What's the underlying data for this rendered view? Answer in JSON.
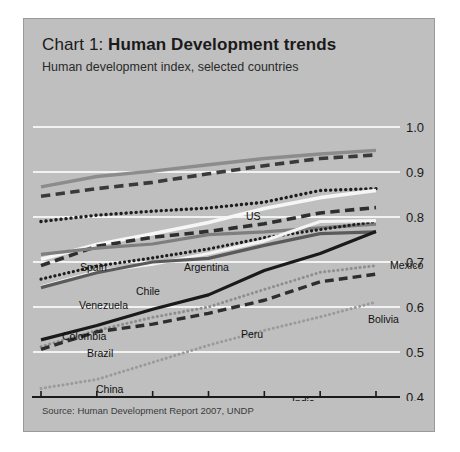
{
  "panel": {
    "background_color": "#bfbfbf",
    "border_color": "#9a9a9a"
  },
  "header": {
    "title_lead": "Chart 1: ",
    "title_strong": "Human Development trends",
    "subtitle": "Human development index, selected countries"
  },
  "footer": {
    "source": "Source: Human Development Report 2007, UNDP"
  },
  "chart_data": {
    "type": "line",
    "title": "Chart 1: Human Development trends",
    "subtitle": "Human development index, selected countries",
    "xlabel": "",
    "ylabel": "Human development index",
    "x": [
      1975,
      1980,
      1985,
      1990,
      1995,
      2000,
      2004
    ],
    "xtick_labels": [
      "1975",
      "1980",
      "1985",
      "1990",
      "1995",
      "2000",
      "04"
    ],
    "ylim": [
      0.4,
      1.0
    ],
    "ytick_labels": [
      "0.4",
      "0.5",
      "0.6",
      "0.7",
      "0.8",
      "0.9",
      "1.0"
    ],
    "yticks": [
      0.4,
      0.5,
      0.6,
      0.7,
      0.8,
      0.9,
      1.0
    ],
    "grid": true,
    "grid_color": "#f2f2f2",
    "axis_color": "#1a1a1a",
    "legend": "inline-labels",
    "series": [
      {
        "name": "US",
        "style": "solid",
        "color": "#8c8c8c",
        "width": 3.4,
        "values": [
          0.867,
          0.89,
          0.902,
          0.916,
          0.93,
          0.94,
          0.948
        ]
      },
      {
        "name": "Spain",
        "style": "dashed",
        "color": "#3a3a3a",
        "width": 3.6,
        "values": [
          0.846,
          0.863,
          0.877,
          0.896,
          0.914,
          0.93,
          0.938
        ]
      },
      {
        "name": "Argentina",
        "style": "dotted",
        "color": "#1e1e1e",
        "width": 3.4,
        "values": [
          0.79,
          0.804,
          0.813,
          0.82,
          0.833,
          0.859,
          0.863
        ]
      },
      {
        "name": "Chile",
        "style": "solid",
        "color": "#f6f6f6",
        "width": 3.6,
        "values": [
          0.706,
          0.739,
          0.763,
          0.788,
          0.819,
          0.843,
          0.859
        ]
      },
      {
        "name": "Mexico",
        "style": "dashed",
        "color": "#2e2e2e",
        "width": 3.6,
        "values": [
          0.692,
          0.735,
          0.755,
          0.768,
          0.785,
          0.809,
          0.821
        ]
      },
      {
        "name": "Venezuela",
        "style": "solid",
        "color": "#7e7e7e",
        "width": 3.2,
        "values": [
          0.717,
          0.731,
          0.74,
          0.761,
          0.767,
          0.776,
          0.784
        ]
      },
      {
        "name": "Colombia",
        "style": "dotted",
        "color": "#1e1e1e",
        "width": 3.2,
        "values": [
          0.662,
          0.691,
          0.709,
          0.729,
          0.754,
          0.772,
          0.79
        ]
      },
      {
        "name": "Brazil",
        "style": "solid",
        "color": "#f3f3f3",
        "width": 3.2,
        "values": [
          0.645,
          0.679,
          0.695,
          0.719,
          0.747,
          0.79,
          0.792
        ]
      },
      {
        "name": "Peru",
        "style": "solid",
        "color": "#5a5a5a",
        "width": 3.2,
        "values": [
          0.643,
          0.676,
          0.7,
          0.708,
          0.737,
          0.763,
          0.767
        ]
      },
      {
        "name": "China",
        "style": "solid",
        "color": "#1a1a1a",
        "width": 3.2,
        "values": [
          0.527,
          0.559,
          0.595,
          0.627,
          0.681,
          0.719,
          0.768
        ]
      },
      {
        "name": "Bolivia",
        "style": "dotted",
        "color": "#8e8e8e",
        "width": 3.0,
        "values": [
          0.512,
          0.548,
          0.577,
          0.6,
          0.639,
          0.677,
          0.692
        ]
      },
      {
        "name": "Guatemala",
        "style": "dashed",
        "color": "#2e2e2e",
        "width": 3.4,
        "values": [
          0.506,
          0.545,
          0.562,
          0.586,
          0.615,
          0.656,
          0.673
        ]
      },
      {
        "name": "India",
        "style": "dotted",
        "color": "#9a9a9a",
        "width": 3.0,
        "values": [
          0.419,
          0.439,
          0.477,
          0.515,
          0.548,
          0.578,
          0.611
        ]
      }
    ],
    "annotations": [
      {
        "label": "US",
        "x": 222,
        "y": 139,
        "anchor": "start"
      },
      {
        "label": "Spain",
        "x": 56,
        "y": 190,
        "anchor": "start"
      },
      {
        "label": "Argentina",
        "x": 160,
        "y": 190,
        "anchor": "start"
      },
      {
        "label": "Mexico",
        "x": 366,
        "y": 188,
        "anchor": "start"
      },
      {
        "label": "Chile",
        "x": 112,
        "y": 214,
        "anchor": "start"
      },
      {
        "label": "Venezuela",
        "x": 55,
        "y": 228,
        "anchor": "start"
      },
      {
        "label": "Colombia",
        "x": 38,
        "y": 259,
        "anchor": "start"
      },
      {
        "label": "Brazil",
        "x": 63,
        "y": 276,
        "anchor": "start"
      },
      {
        "label": "Peru",
        "x": 217,
        "y": 257,
        "anchor": "start"
      },
      {
        "label": "Bolivia",
        "x": 344,
        "y": 242,
        "anchor": "start"
      },
      {
        "label": "China",
        "x": 72,
        "y": 312,
        "anchor": "start"
      },
      {
        "label": "Guatemala",
        "x": 150,
        "y": 330,
        "anchor": "start"
      },
      {
        "label": "India",
        "x": 268,
        "y": 325,
        "anchor": "start"
      }
    ]
  }
}
